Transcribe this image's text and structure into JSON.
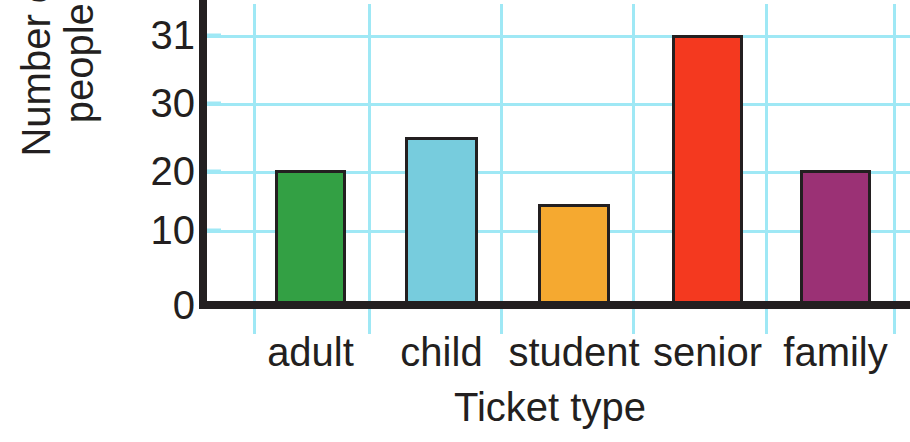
{
  "chart_data": {
    "type": "bar",
    "title": "",
    "xlabel": "Ticket type",
    "ylabel": "Number of\npeople",
    "categories": [
      "adult",
      "child",
      "student",
      "senior",
      "family"
    ],
    "values": [
      20,
      25,
      15,
      31,
      20
    ],
    "bar_colors": [
      "#33a044",
      "#77ccdd",
      "#f5a930",
      "#f4391f",
      "#9b3175"
    ],
    "bar_outline_color": "#231f20",
    "ytick_labels": [
      "0",
      "10",
      "20",
      "30",
      "31"
    ],
    "ytick_values": [
      0,
      10,
      20,
      30,
      31
    ],
    "ylim": [
      0,
      31
    ],
    "grid": true,
    "grid_color": "#9fe8f5",
    "axis_color": "#231f20",
    "legend": "none",
    "background": "#ffffff"
  },
  "axis_titles": {
    "y": "Number of\npeople",
    "x": "Ticket type"
  }
}
